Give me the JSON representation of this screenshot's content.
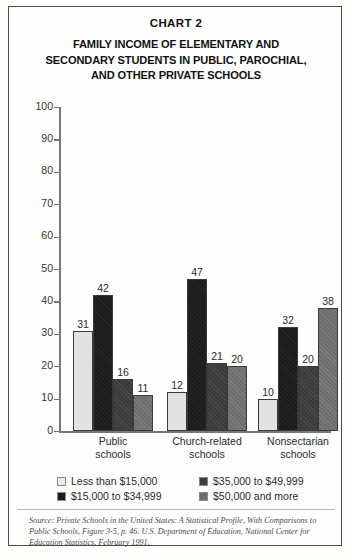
{
  "chart_label": "CHART 2",
  "subtitle_lines": [
    "FAMILY INCOME OF ELEMENTARY AND",
    "SECONDARY STUDENTS IN PUBLIC, PAROCHIAL,",
    "AND OTHER PRIVATE SCHOOLS"
  ],
  "source_note": "Source: Private Schools in the United States: A Statistical Profile, With Comparisons to Public Schools, Figure 3-5, p. 46. U.S. Department of Education, National Center for Education Statistics, February 1991.",
  "legend": [
    {
      "label": "Less than $15,000",
      "color": "#ececec"
    },
    {
      "label": "$15,000 to $34,999",
      "color": "#1c1c1c"
    },
    {
      "label": "$35,000 to $49,999",
      "color": "#3b3b3b"
    },
    {
      "label": "$50,000 and more",
      "color": "#6e6e6e"
    }
  ],
  "axis": {
    "ticks": [
      "100",
      "90",
      "80",
      "70",
      "60",
      "50",
      "40",
      "30",
      "20",
      "10",
      "0"
    ]
  },
  "categories_wrapped": [
    [
      "Public",
      "schools"
    ],
    [
      "Church-related",
      "schools"
    ],
    [
      "Nonsectarian",
      "schools"
    ]
  ],
  "chart_data": {
    "type": "bar",
    "title": "FAMILY INCOME OF ELEMENTARY AND SECONDARY STUDENTS IN PUBLIC, PAROCHIAL, AND OTHER PRIVATE SCHOOLS",
    "subtitle": "CHART 2",
    "xlabel": "",
    "ylabel": "",
    "ylim": [
      0,
      100
    ],
    "yticks": [
      0,
      10,
      20,
      30,
      40,
      50,
      60,
      70,
      80,
      90,
      100
    ],
    "grid": false,
    "legend_position": "bottom",
    "categories": [
      "Public schools",
      "Church-related schools",
      "Nonsectarian schools"
    ],
    "series": [
      {
        "name": "Less than $15,000",
        "color": "#ececec",
        "values": [
          31,
          12,
          10
        ]
      },
      {
        "name": "$15,000 to $34,999",
        "color": "#1c1c1c",
        "values": [
          42,
          47,
          32
        ]
      },
      {
        "name": "$35,000 to $49,999",
        "color": "#3b3b3b",
        "values": [
          16,
          21,
          20
        ]
      },
      {
        "name": "$50,000 and more",
        "color": "#6e6e6e",
        "values": [
          11,
          20,
          38
        ]
      }
    ]
  }
}
